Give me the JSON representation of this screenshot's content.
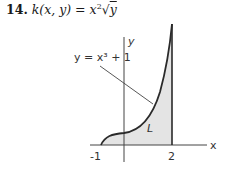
{
  "problem": {
    "number": "14.",
    "function_lhs": "k(x, y)",
    "equals": "=",
    "function_rhs_base": "x",
    "function_rhs_exp": "2",
    "function_rhs_sqrt": "√",
    "function_rhs_radicand": "y"
  },
  "figure": {
    "curve_label": "y = x³ + 1",
    "region_label": "L",
    "x_axis_label": "x",
    "y_axis_label": "y",
    "tick_labels": [
      "-1",
      "2"
    ],
    "region_fill": "#e4e4e4",
    "line_color": "#2a2a2a"
  }
}
